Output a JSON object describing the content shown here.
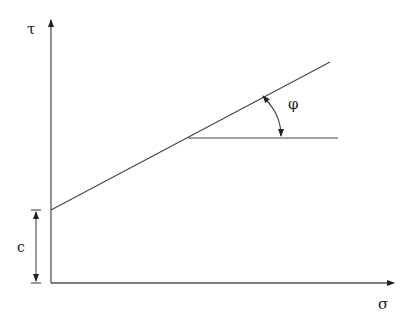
{
  "diagram": {
    "labels": {
      "y_axis": "τ",
      "x_axis": "σ",
      "angle": "φ",
      "intercept": "c"
    },
    "colors": {
      "line": "#4a4a4a",
      "text": "#222222",
      "background": "#ffffff"
    }
  }
}
